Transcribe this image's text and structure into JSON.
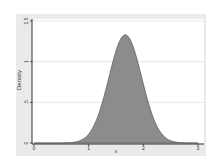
{
  "chart_data": {
    "type": "area",
    "title": "",
    "xlabel": "x",
    "ylabel": "Density",
    "xlim": [
      0,
      3
    ],
    "ylim": [
      0,
      1.5
    ],
    "x_ticks": [
      0,
      1,
      2,
      3
    ],
    "x_tick_labels": [
      "0",
      "1",
      "2",
      "3"
    ],
    "y_ticks": [
      0,
      0.5,
      1,
      1.5
    ],
    "y_tick_labels": [
      "0",
      ".5",
      "1",
      "1.5"
    ],
    "grid": {
      "horizontal": true,
      "vertical": false
    },
    "legend": null,
    "series": [
      {
        "name": "density",
        "distribution": "normal",
        "mean": 1.67,
        "sd": 0.3,
        "peak": {
          "x": 1.67,
          "y": 1.34
        },
        "x": [
          0,
          0.25,
          0.5,
          0.75,
          1.0,
          1.25,
          1.5,
          1.67,
          1.85,
          2.0,
          2.25,
          2.5,
          2.75,
          3.0
        ],
        "values": [
          0.0,
          0.0,
          0.0,
          0.012,
          0.11,
          0.5,
          1.13,
          1.34,
          1.11,
          0.73,
          0.21,
          0.03,
          0.002,
          0.0
        ]
      }
    ],
    "colors": {
      "fill": "#8c8c8c",
      "outline": "#555555",
      "plot_background": "#ffffff",
      "outer_background": "#e9ebeb",
      "grid": "#e4e6e6",
      "axis": "#333333"
    }
  }
}
